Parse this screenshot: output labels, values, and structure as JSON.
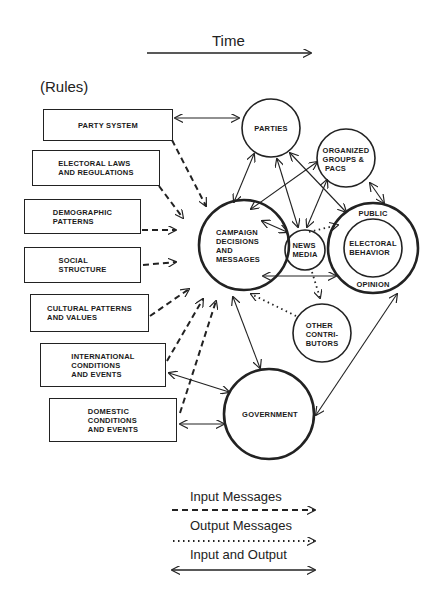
{
  "header": {
    "time_label": "Time",
    "rules_label": "(Rules)"
  },
  "boxes": [
    {
      "id": "party-system",
      "label": "PARTY SYSTEM"
    },
    {
      "id": "electoral-laws",
      "label": "ELECTORAL LAWS\nAND REGULATIONS"
    },
    {
      "id": "demographic-patterns",
      "label": "DEMOGRAPHIC\nPATTERNS"
    },
    {
      "id": "social-structure",
      "label": "SOCIAL\nSTRUCTURE"
    },
    {
      "id": "cultural-patterns",
      "label": "CULTURAL PATTERNS\nAND VALUES"
    },
    {
      "id": "international-conditions",
      "label": "INTERNATIONAL\nCONDITIONS\nAND EVENTS"
    },
    {
      "id": "domestic-conditions",
      "label": "DOMESTIC\nCONDITIONS\nAND EVENTS"
    }
  ],
  "circles": {
    "parties": "PARTIES",
    "organized_groups": "ORGANIZED\nGROUPS &\n PACS",
    "campaign": "CAMPAIGN\nDECISIONS\nAND\nMESSAGES",
    "news_media": "NEWS\nMEDIA",
    "public_label": "PUBLIC",
    "electoral_behavior": "ELECTORAL\nBEHAVIOR",
    "opinion_label": "OPINION",
    "other_contributors": "OTHER\nCONTRI-\nBUTORS",
    "government": "GOVERNMENT"
  },
  "legend": {
    "input": "Input Messages",
    "output": "Output Messages",
    "both": "Input and Output"
  }
}
